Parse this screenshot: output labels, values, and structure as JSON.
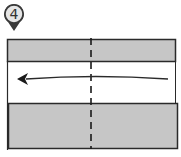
{
  "step": {
    "number": "4",
    "badge_fill": "#e6e6e6",
    "badge_stroke": "#3a3a3a"
  },
  "diagram": {
    "paper_fill": "#c6c6c6",
    "outline_color": "#2a2a2a",
    "fold_line": "dashed-vertical-center",
    "arrow_direction": "left"
  }
}
